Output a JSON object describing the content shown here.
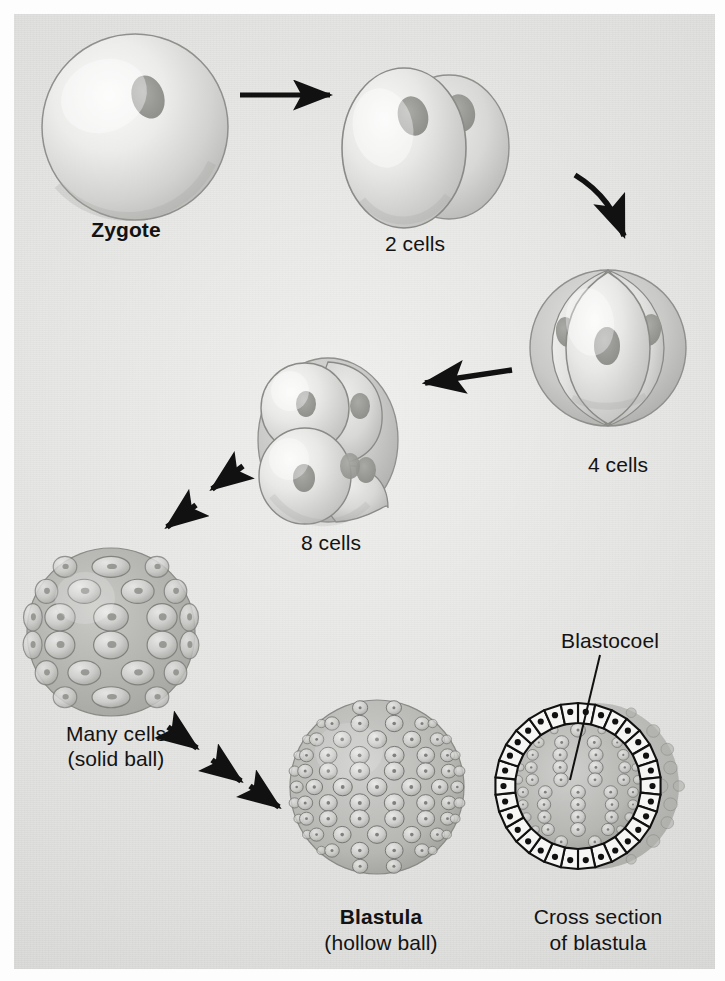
{
  "figure": {
    "background_color": "#dcdcda",
    "ink_color": "#131313"
  },
  "stages": [
    {
      "id": "zygote",
      "label": "Zygote",
      "bold": true,
      "cell_count": 1,
      "description": "single spherical cell with one nucleus"
    },
    {
      "id": "two-cells",
      "label": "2 cells",
      "bold": false,
      "cell_count": 2,
      "description": "two rounded blastomeres, each with a nucleus"
    },
    {
      "id": "four-cells",
      "label": "4 cells",
      "bold": false,
      "cell_count": 4,
      "description": "four wedge-shaped blastomeres like orange segments"
    },
    {
      "id": "eight-cells",
      "label": "8 cells",
      "bold": false,
      "cell_count": 8,
      "description": "eight blastomeres in two tiers of four"
    },
    {
      "id": "morula",
      "label_line1": "Many cells",
      "label_line2": "(solid ball)",
      "bold": false,
      "description": "morula, solid ball of many blocky cells"
    },
    {
      "id": "blastula",
      "label_line1": "Blastula",
      "label_line2": "(hollow ball)",
      "bold": true,
      "description": "hollow ball covered in many small polygonal cells"
    },
    {
      "id": "cross-section",
      "label_line1": "Cross section",
      "label_line2": "of blastula",
      "bold": false,
      "description": "cut-away view showing a single layer of columnar cells around a cavity"
    }
  ],
  "annotations": [
    {
      "id": "blastocoel",
      "label": "Blastocoel",
      "description": "fluid-filled cavity inside the blastula, indicated by a leader line"
    }
  ],
  "arrows": [
    {
      "id": "arrow-zygote-to-2",
      "style": "solid",
      "from": "zygote",
      "to": "two-cells"
    },
    {
      "id": "arrow-2-to-4",
      "style": "solid",
      "from": "two-cells",
      "to": "four-cells"
    },
    {
      "id": "arrow-4-to-8",
      "style": "solid",
      "from": "four-cells",
      "to": "eight-cells"
    },
    {
      "id": "arrow-8-to-morula",
      "style": "double",
      "from": "eight-cells",
      "to": "morula"
    },
    {
      "id": "arrow-morula-to-blastula",
      "style": "triple",
      "from": "morula",
      "to": "blastula"
    }
  ]
}
